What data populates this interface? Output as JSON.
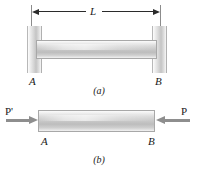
{
  "figure": {
    "panel_a": {
      "caption": "(a)",
      "dimension_label": "L",
      "node_left_label": "A",
      "node_right_label": "B"
    },
    "panel_b": {
      "caption": "(b)",
      "force_left_label": "P'",
      "force_right_label": "P",
      "node_left_label": "A",
      "node_right_label": "B"
    }
  },
  "colors": {
    "bar_mid": "#c9c9c9",
    "bar_light": "#fbfbfb",
    "support_mid": "#c4c4c4",
    "arrow": "#8e8e8e",
    "dimension_line": "#2b2b2b",
    "extension_line": "#8c8c8c",
    "text": "#1a1a1a",
    "background": "#ffffff"
  }
}
